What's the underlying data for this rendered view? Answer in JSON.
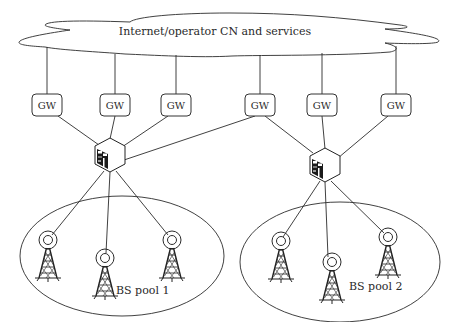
{
  "diagram": {
    "cloud": {
      "label": "Internet/operator CN and services",
      "x": 215,
      "y": 32
    },
    "gateways": [
      {
        "label": "GW",
        "x": 47,
        "y": 105
      },
      {
        "label": "GW",
        "x": 115,
        "y": 105
      },
      {
        "label": "GW",
        "x": 176,
        "y": 105
      },
      {
        "label": "GW",
        "x": 260,
        "y": 105
      },
      {
        "label": "GW",
        "x": 322,
        "y": 105
      },
      {
        "label": "GW",
        "x": 396,
        "y": 105
      }
    ],
    "routers": [
      {
        "name": "router-1",
        "x": 110,
        "y": 155
      },
      {
        "name": "router-2",
        "x": 325,
        "y": 165
      }
    ],
    "pools": [
      {
        "label": "BS pool 1",
        "ellipse": {
          "cx": 122,
          "cy": 256,
          "rx": 102,
          "ry": 60
        },
        "label_pos": {
          "x": 116,
          "y": 294
        },
        "towers": [
          {
            "x": 48,
            "y": 240
          },
          {
            "x": 105,
            "y": 258
          },
          {
            "x": 172,
            "y": 240
          }
        ]
      },
      {
        "label": "BS pool 2",
        "ellipse": {
          "cx": 340,
          "cy": 262,
          "rx": 100,
          "ry": 60
        },
        "label_pos": {
          "x": 349,
          "y": 290
        },
        "towers": [
          {
            "x": 281,
            "y": 242
          },
          {
            "x": 332,
            "y": 262
          },
          {
            "x": 388,
            "y": 238
          }
        ]
      }
    ],
    "links": {
      "gw_to_router1": [
        0,
        1,
        2,
        3
      ],
      "gw_to_router2": [
        3,
        4,
        5
      ]
    },
    "colors": {
      "stroke": "#2b2b2b",
      "background": "#ffffff"
    }
  }
}
